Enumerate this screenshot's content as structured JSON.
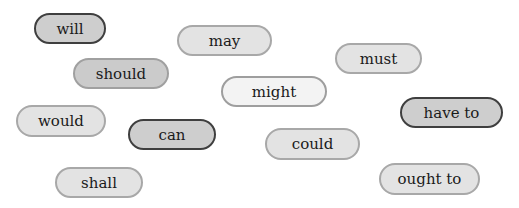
{
  "modal_verbs": [
    {
      "label": "will",
      "style": "dark",
      "x": 34,
      "y": 13,
      "w": 72,
      "h": 31
    },
    {
      "label": "may",
      "style": "light",
      "x": 177,
      "y": 25,
      "w": 95,
      "h": 31
    },
    {
      "label": "must",
      "style": "light",
      "x": 335,
      "y": 43,
      "w": 87,
      "h": 31
    },
    {
      "label": "should",
      "style": "medium",
      "x": 73,
      "y": 58,
      "w": 96,
      "h": 31
    },
    {
      "label": "might",
      "style": "lightest",
      "x": 221,
      "y": 76,
      "w": 106,
      "h": 31
    },
    {
      "label": "have to",
      "style": "dark",
      "x": 400,
      "y": 97,
      "w": 103,
      "h": 31
    },
    {
      "label": "would",
      "style": "light",
      "x": 16,
      "y": 105,
      "w": 90,
      "h": 32
    },
    {
      "label": "can",
      "style": "dark",
      "x": 128,
      "y": 119,
      "w": 88,
      "h": 31
    },
    {
      "label": "could",
      "style": "light",
      "x": 265,
      "y": 128,
      "w": 95,
      "h": 32
    },
    {
      "label": "shall",
      "style": "light",
      "x": 55,
      "y": 167,
      "w": 88,
      "h": 31
    },
    {
      "label": "ought to",
      "style": "light",
      "x": 379,
      "y": 163,
      "w": 101,
      "h": 32
    }
  ],
  "colors": {
    "dark_border": "#3f3f3f",
    "dark_fill": "#cecece",
    "light_border": "#a8a8a8",
    "light_fill": "#e3e3e3",
    "lightest_fill": "#f3f3f3",
    "text": "#1a1a1a"
  }
}
